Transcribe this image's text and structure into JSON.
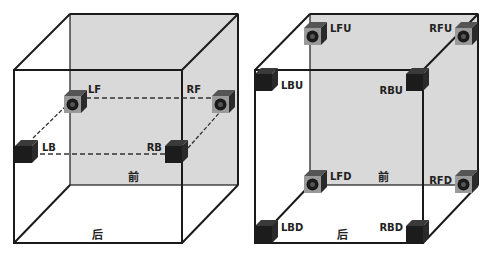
{
  "diagrams": [
    {
      "name": "four-speaker-layout",
      "face_labels": {
        "front": "前",
        "back": "后"
      },
      "speakers": [
        {
          "id": "LF",
          "label": "LF",
          "type": "front"
        },
        {
          "id": "RF",
          "label": "RF",
          "type": "front"
        },
        {
          "id": "LB",
          "label": "LB",
          "type": "back"
        },
        {
          "id": "RB",
          "label": "RB",
          "type": "back"
        }
      ]
    },
    {
      "name": "eight-speaker-layout",
      "face_labels": {
        "front": "前",
        "back": "后"
      },
      "speakers": [
        {
          "id": "LFU",
          "label": "LFU",
          "type": "front"
        },
        {
          "id": "RFU",
          "label": "RFU",
          "type": "front"
        },
        {
          "id": "LBU",
          "label": "LBU",
          "type": "back"
        },
        {
          "id": "RBU",
          "label": "RBU",
          "type": "back"
        },
        {
          "id": "LFD",
          "label": "LFD",
          "type": "front"
        },
        {
          "id": "RFD",
          "label": "RFD",
          "type": "front"
        },
        {
          "id": "LBD",
          "label": "LBD",
          "type": "back"
        },
        {
          "id": "RBD",
          "label": "RBD",
          "type": "back"
        }
      ]
    }
  ],
  "colors": {
    "shaded_face": "#d9d9d9",
    "edge": "#1a1a1a",
    "speaker_front_face": "#9a9a9a",
    "speaker_dark": "#1c1c1c"
  }
}
